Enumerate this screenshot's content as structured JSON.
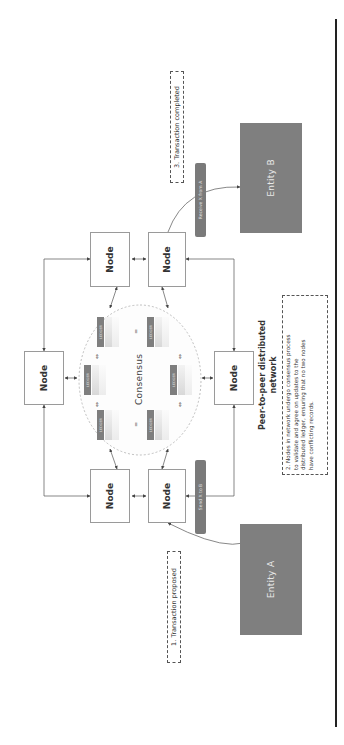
{
  "diagram": {
    "title": "Peer-to-peer distributed network",
    "title_line1": "Peer-to-peer distributed",
    "title_line2": "network",
    "orientation": "rotated -90deg (text reads bottom-to-top)",
    "colors": {
      "entity_fill": "#7f7f7f",
      "pill_fill": "#7a7a7a",
      "node_border": "#9a9a9a",
      "frame_line": "#222222",
      "ellipse_stroke": "#b0b0b0"
    },
    "nodes": [
      {
        "id": "node-1",
        "label": "Node"
      },
      {
        "id": "node-2",
        "label": "Node"
      },
      {
        "id": "node-3",
        "label": "Node"
      },
      {
        "id": "node-4",
        "label": "Node"
      },
      {
        "id": "node-5",
        "label": "Node"
      },
      {
        "id": "node-6",
        "label": "Node"
      }
    ],
    "consensus": {
      "label": "Consensus",
      "ledgers": [
        {
          "label": "LEDGER"
        },
        {
          "label": "LEDGER"
        },
        {
          "label": "LEDGER"
        },
        {
          "label": "LEDGER"
        },
        {
          "label": "LEDGER"
        },
        {
          "label": "LEDGER"
        }
      ],
      "equals_symbol": "=",
      "equiv_symbol": "⇔"
    },
    "entities": {
      "a": {
        "label": "Entity A"
      },
      "b": {
        "label": "Entity B"
      }
    },
    "edges": {
      "send": {
        "label": "Send X to B"
      },
      "receive": {
        "label": "Receive X from A"
      }
    },
    "steps": [
      {
        "text": "1. Transaction proposed"
      },
      {
        "text": "2. Nodes in network undergo consensus process to validate and agree on updates to the distributed ledger, ensuring that no two nodes have conflicting records."
      },
      {
        "text": "3. Transaction completed"
      }
    ],
    "step2_lines": [
      "2. Nodes in network undergo consensus process",
      "to validate and agree on updates to the",
      "distributed ledger, ensuring that no two nodes",
      "have conflicting records."
    ]
  }
}
